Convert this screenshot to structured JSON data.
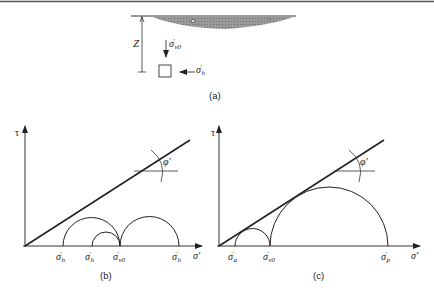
{
  "figure": {
    "panel_a": {
      "caption": "(a)",
      "depth_label": "Z",
      "vertical_stress": {
        "symbol": "σ",
        "prime": "′",
        "subscript": "v0"
      },
      "horizontal_stress": {
        "symbol": "σ",
        "prime": "′",
        "subscript": "h"
      }
    },
    "panel_b": {
      "caption": "(b)",
      "y_axis_label": "τ",
      "x_axis_label": "σ′",
      "friction_angle_label": "φ′",
      "x_points": [
        {
          "symbol": "σ",
          "prime": "′",
          "subscript": "h"
        },
        {
          "symbol": "σ",
          "prime": "′",
          "subscript": "h"
        },
        {
          "symbol": "σ",
          "prime": "′",
          "subscript": "v0"
        },
        {
          "symbol": "σ",
          "prime": "′",
          "subscript": "h"
        }
      ]
    },
    "panel_c": {
      "caption": "(c)",
      "y_axis_label": "τ",
      "x_axis_label": "σ′",
      "friction_angle_label": "φ′",
      "x_points": [
        {
          "symbol": "σ",
          "prime": "′",
          "subscript": "a"
        },
        {
          "symbol": "σ",
          "prime": "′",
          "subscript": "v0"
        },
        {
          "symbol": "σ",
          "prime": "′",
          "subscript": "p"
        }
      ]
    }
  }
}
